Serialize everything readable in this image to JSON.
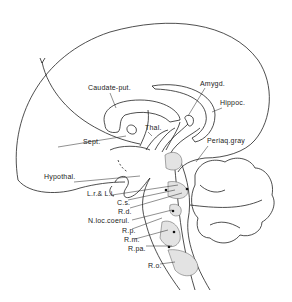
{
  "figure": {
    "labels": {
      "caudate_put": "Caudate-put.",
      "amygd": "Amygd.",
      "hippoc": "Hippoc.",
      "thal": "Thal.",
      "sept": "Sept.",
      "periaq_gray": "Periaq.gray",
      "hypothal": "Hypothal.",
      "lr_li": "L.r.& L.i.",
      "cs": "C.s.",
      "rd": "R.d.",
      "n_loc_coerul": "N.loc.coerul.",
      "rp": "R.p.",
      "rm": "R.m.",
      "rpa": "R.pa.",
      "ro": "R.o."
    },
    "colors": {
      "line": "#222222",
      "nucleus_fill": "#e3e3e3",
      "background": "#ffffff"
    }
  }
}
